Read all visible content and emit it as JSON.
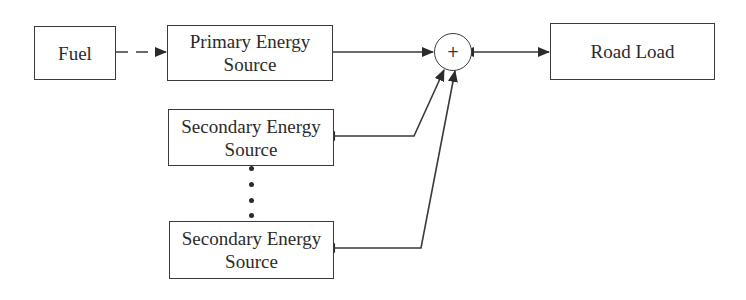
{
  "diagram": {
    "type": "block-diagram",
    "colors": {
      "stroke": "#3a3a3a",
      "text": "#2b2b2b",
      "background": "#ffffff"
    },
    "nodes": {
      "fuel": {
        "label": "Fuel"
      },
      "primary": {
        "line1": "Primary Energy",
        "line2": "Source"
      },
      "secondary_1": {
        "line1": "Secondary Energy",
        "line2": "Source"
      },
      "secondary_n": {
        "line1": "Secondary Energy",
        "line2": "Source"
      },
      "summing_junction": {
        "symbol": "+"
      },
      "road_load": {
        "label": "Road Load"
      }
    },
    "ellipsis": "⋮",
    "edges": [
      {
        "from": "Fuel",
        "to": "Primary Energy Source",
        "style": "dashed",
        "direction": "forward"
      },
      {
        "from": "Primary Energy Source",
        "to": "+",
        "style": "solid",
        "direction": "forward"
      },
      {
        "from": "Secondary Energy Source (1)",
        "to": "+",
        "style": "solid",
        "direction": "bidirectional"
      },
      {
        "from": "Secondary Energy Source (n)",
        "to": "+",
        "style": "solid",
        "direction": "bidirectional"
      },
      {
        "from": "+",
        "to": "Road Load",
        "style": "solid",
        "direction": "bidirectional"
      }
    ]
  }
}
